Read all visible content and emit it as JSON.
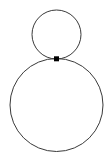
{
  "canvas": {
    "width": 109,
    "height": 160,
    "background_color": "#ffffff"
  },
  "figure": {
    "title": "",
    "stroke_color": "#3a3a3a",
    "stroke_width": 1,
    "fill": "none",
    "node_color": "#000000"
  },
  "shapes": [
    {
      "name": "small-circle",
      "type": "circle",
      "cx": 56.5,
      "cy": 34.5,
      "r": 24.5,
      "stroke_color": "#3a3a3a",
      "stroke_width": 1,
      "fill": "none",
      "label": ""
    },
    {
      "name": "large-circle",
      "type": "circle",
      "cx": 56.5,
      "cy": 105,
      "r": 46.5,
      "stroke_color": "#3a3a3a",
      "stroke_width": 1,
      "fill": "none",
      "label": ""
    }
  ],
  "nodes": [
    {
      "name": "tangent-point",
      "type": "point",
      "cx": 56.5,
      "cy": 58.8,
      "size": 5,
      "shape": "square",
      "color": "#000000",
      "label": ""
    }
  ],
  "artifacts": {
    "top_edge_faint_marks": true,
    "note": ""
  }
}
